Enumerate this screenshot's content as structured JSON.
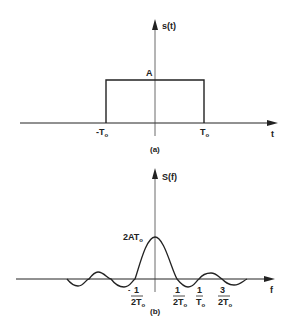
{
  "figure_a": {
    "caption": "(a)",
    "y_axis_label": "s(t)",
    "x_axis_label": "t",
    "amplitude_label": "A",
    "left_edge_label": "-T",
    "right_edge_label": "T",
    "subscript": "o"
  },
  "figure_b": {
    "caption": "(b)",
    "y_axis_label": "S(f)",
    "x_axis_label": "f",
    "peak_label": "2AT",
    "peak_sub": "o",
    "ticks": [
      {
        "num": "1",
        "den": "2T",
        "sign": "-"
      },
      {
        "num": "1",
        "den": "2T",
        "sign": ""
      },
      {
        "num": "1",
        "den": "T",
        "sign": ""
      },
      {
        "num": "3",
        "den": "2T",
        "sign": ""
      }
    ],
    "subscript": "o"
  },
  "colors": {
    "ink": "#222222",
    "background": "#ffffff"
  }
}
